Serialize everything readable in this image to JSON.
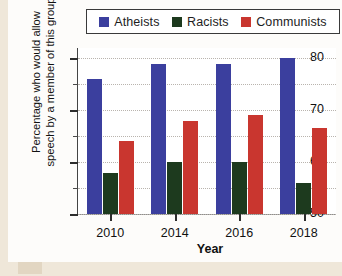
{
  "chart_data": {
    "type": "bar",
    "title": "",
    "xlabel": "Year",
    "ylabel": "Percentage who would allow speech by a member of this group",
    "categories": [
      "2010",
      "2014",
      "2016",
      "2018"
    ],
    "ylim": [
      50,
      82
    ],
    "ytick_labels": [
      "50",
      "60",
      "70",
      "80"
    ],
    "ytick_values": [
      50,
      60,
      70,
      80
    ],
    "yminor_values": [
      55,
      65,
      75
    ],
    "grid": true,
    "legend_position": "top",
    "series": [
      {
        "name": "Atheists",
        "color": "#3b3f9e",
        "values": [
          76,
          79,
          79,
          80
        ]
      },
      {
        "name": "Racists",
        "color": "#1d3a1e",
        "values": [
          58,
          60,
          60,
          56
        ]
      },
      {
        "name": "Communists",
        "color": "#c9362f",
        "values": [
          64,
          68,
          69,
          66.5
        ]
      }
    ]
  },
  "legend": {
    "items": [
      {
        "label": "Atheists",
        "color": "#3b3f9e"
      },
      {
        "label": "Racists",
        "color": "#1d3a1e"
      },
      {
        "label": "Communists",
        "color": "#c9362f"
      }
    ]
  },
  "axes": {
    "y_title": "Percentage who would allow speech by a member of this group",
    "x_title": "Year"
  },
  "colors": {
    "page_background": "#efe7d9",
    "panel_background": "#fdfcfa",
    "plot_background": "#ffffff",
    "grid": "#b9b4ae",
    "axis": "#2d2d2d"
  }
}
